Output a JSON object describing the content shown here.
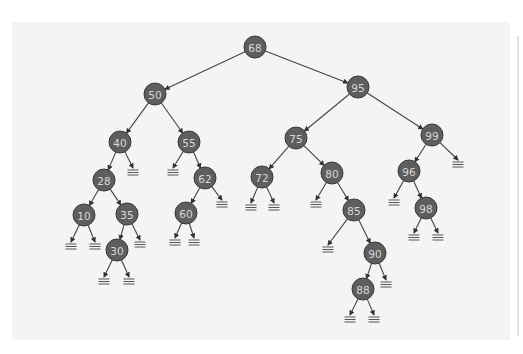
{
  "diagram": {
    "type": "binary-search-tree",
    "colors": {
      "background": "#f4f4f4",
      "node_fill": "#5e5e5e",
      "node_text": "#d8d8d8",
      "edge": "#444444"
    },
    "nodes": [
      {
        "id": "n68",
        "label": "68",
        "x": 255,
        "y": 47
      },
      {
        "id": "n50",
        "label": "50",
        "x": 155,
        "y": 94
      },
      {
        "id": "n95",
        "label": "95",
        "x": 358,
        "y": 87
      },
      {
        "id": "n40",
        "label": "40",
        "x": 120,
        "y": 142
      },
      {
        "id": "n55",
        "label": "55",
        "x": 189,
        "y": 142
      },
      {
        "id": "n28",
        "label": "28",
        "x": 104,
        "y": 180
      },
      {
        "id": "n62",
        "label": "62",
        "x": 205,
        "y": 178
      },
      {
        "id": "n10",
        "label": "10",
        "x": 84,
        "y": 215
      },
      {
        "id": "n35",
        "label": "35",
        "x": 127,
        "y": 214
      },
      {
        "id": "n60",
        "label": "60",
        "x": 186,
        "y": 213
      },
      {
        "id": "n30",
        "label": "30",
        "x": 117,
        "y": 250
      },
      {
        "id": "n75",
        "label": "75",
        "x": 296,
        "y": 138
      },
      {
        "id": "n99",
        "label": "99",
        "x": 432,
        "y": 135
      },
      {
        "id": "n72",
        "label": "72",
        "x": 262,
        "y": 177
      },
      {
        "id": "n80",
        "label": "80",
        "x": 332,
        "y": 173
      },
      {
        "id": "n96",
        "label": "96",
        "x": 409,
        "y": 171
      },
      {
        "id": "n85",
        "label": "85",
        "x": 354,
        "y": 210
      },
      {
        "id": "n98",
        "label": "98",
        "x": 426,
        "y": 208
      },
      {
        "id": "n90",
        "label": "90",
        "x": 375,
        "y": 253
      },
      {
        "id": "n88",
        "label": "88",
        "x": 363,
        "y": 289
      }
    ],
    "edges": [
      [
        "n68",
        "n50"
      ],
      [
        "n68",
        "n95"
      ],
      [
        "n50",
        "n40"
      ],
      [
        "n50",
        "n55"
      ],
      [
        "n40",
        "n28"
      ],
      [
        "n28",
        "n10"
      ],
      [
        "n28",
        "n35"
      ],
      [
        "n35",
        "n30"
      ],
      [
        "n55",
        "n62"
      ],
      [
        "n62",
        "n60"
      ],
      [
        "n95",
        "n75"
      ],
      [
        "n95",
        "n99"
      ],
      [
        "n75",
        "n72"
      ],
      [
        "n75",
        "n80"
      ],
      [
        "n80",
        "n85"
      ],
      [
        "n85",
        "n90"
      ],
      [
        "n90",
        "n88"
      ],
      [
        "n99",
        "n96"
      ],
      [
        "n96",
        "n98"
      ]
    ],
    "nulls": [
      {
        "parent": "n40",
        "x": 133,
        "y": 171
      },
      {
        "parent": "n55",
        "x": 173,
        "y": 171
      },
      {
        "parent": "n10",
        "x": 71,
        "y": 245
      },
      {
        "parent": "n10",
        "x": 95,
        "y": 245
      },
      {
        "parent": "n35",
        "x": 140,
        "y": 243
      },
      {
        "parent": "n30",
        "x": 104,
        "y": 280
      },
      {
        "parent": "n30",
        "x": 129,
        "y": 280
      },
      {
        "parent": "n62",
        "x": 222,
        "y": 203
      },
      {
        "parent": "n60",
        "x": 175,
        "y": 241
      },
      {
        "parent": "n60",
        "x": 194,
        "y": 241
      },
      {
        "parent": "n72",
        "x": 251,
        "y": 206
      },
      {
        "parent": "n72",
        "x": 274,
        "y": 206
      },
      {
        "parent": "n80",
        "x": 316,
        "y": 203
      },
      {
        "parent": "n85",
        "x": 328,
        "y": 248
      },
      {
        "parent": "n90",
        "x": 386,
        "y": 283
      },
      {
        "parent": "n88",
        "x": 350,
        "y": 318
      },
      {
        "parent": "n88",
        "x": 374,
        "y": 318
      },
      {
        "parent": "n99",
        "x": 458,
        "y": 163
      },
      {
        "parent": "n96",
        "x": 394,
        "y": 201
      },
      {
        "parent": "n98",
        "x": 414,
        "y": 236
      },
      {
        "parent": "n98",
        "x": 438,
        "y": 236
      }
    ]
  }
}
